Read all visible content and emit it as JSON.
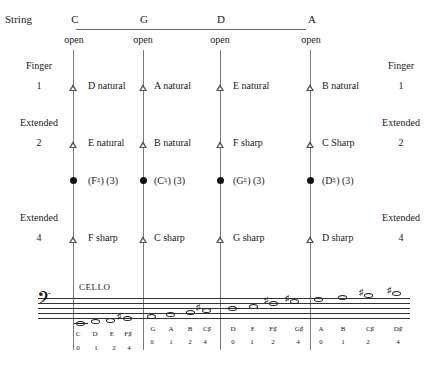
{
  "header": {
    "row_label": "String",
    "strings": [
      "C",
      "G",
      "D",
      "A"
    ],
    "open_label": "open"
  },
  "left_labels": {
    "finger": "Finger",
    "finger_num": "1",
    "extended_a": "Extended",
    "extended_a_num": "2",
    "extended_b": "Extended",
    "extended_b_num": "4"
  },
  "right_labels": {
    "finger": "Finger",
    "finger_num": "1",
    "extended_a": "Extended",
    "extended_a_num": "2",
    "extended_b": "Extended",
    "extended_b_num": "4"
  },
  "rows": {
    "finger1": [
      "D natural",
      "A natural",
      "E natural",
      "B natural"
    ],
    "extended2": [
      "E natural",
      "B natural",
      "F sharp",
      "C Sharp"
    ],
    "third_finger": [
      "(F♮) (3)",
      "(C♮) (3)",
      "(G♮) (3)",
      "(D♮) (3)"
    ],
    "extended4": [
      "F sharp",
      "C sharp",
      "G sharp",
      "D sharp"
    ]
  },
  "staff": {
    "instrument": "CELLO",
    "clef": "bass-clef",
    "groups": [
      {
        "string": "C",
        "notes": [
          "C",
          "D",
          "E",
          "F♯"
        ],
        "fingers": [
          "0",
          "1",
          "2",
          "4"
        ]
      },
      {
        "string": "G",
        "notes": [
          "G",
          "A",
          "B",
          "C♯"
        ],
        "fingers": [
          "0",
          "1",
          "2",
          "4"
        ]
      },
      {
        "string": "D",
        "notes": [
          "D",
          "E",
          "F♯",
          "G♯"
        ],
        "fingers": [
          "0",
          "1",
          "2",
          "4"
        ]
      },
      {
        "string": "A",
        "notes": [
          "A",
          "B",
          "C♯",
          "D♯"
        ],
        "fingers": [
          "0",
          "1",
          "2",
          "4"
        ]
      }
    ]
  }
}
